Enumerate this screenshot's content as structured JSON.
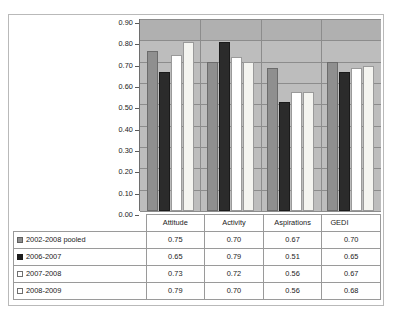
{
  "chart_data": {
    "type": "bar",
    "title": "",
    "xlabel": "",
    "ylabel": "",
    "ylim": [
      0.0,
      0.9
    ],
    "ytick_labels": [
      "0.90",
      "0.80",
      "0.70",
      "0.60",
      "0.50",
      "0.40",
      "0.30",
      "0.20",
      "0.10",
      "0.00"
    ],
    "ytick_values": [
      0.9,
      0.8,
      0.7,
      0.6,
      0.5,
      0.4,
      0.3,
      0.2,
      0.1,
      0.0
    ],
    "grid": true,
    "legend_position": "data-table-first-column",
    "categories": [
      "Attitude",
      "Activity",
      "Aspirations",
      "GEDI"
    ],
    "series": [
      {
        "name": "2002-2008 pooled",
        "swatch": "sw0",
        "bar": "s0",
        "values": [
          0.75,
          0.7,
          0.67,
          0.7
        ]
      },
      {
        "name": "2006-2007",
        "swatch": "sw1",
        "bar": "s1",
        "values": [
          0.65,
          0.79,
          0.51,
          0.65
        ]
      },
      {
        "name": "2007-2008",
        "swatch": "sw2",
        "bar": "s2",
        "values": [
          0.73,
          0.72,
          0.56,
          0.67
        ]
      },
      {
        "name": "2008-2009",
        "swatch": "sw3",
        "bar": "s3",
        "values": [
          0.79,
          0.7,
          0.56,
          0.68
        ]
      }
    ],
    "colors": {
      "series_2002_2008_pooled": "#8f8f8f",
      "series_2006_2007": "#2b2b2b",
      "series_2007_2008": "#ffffff",
      "series_2008_2009": "#f4f4f0",
      "plot_background": "#bdbdbd",
      "gridline": "#8c8c8c",
      "frame_border": "#b9b9b9"
    }
  },
  "table": {
    "corner_label": "",
    "headers": [
      "Attitude",
      "Activity",
      "Aspirations",
      "GEDI"
    ],
    "rows": [
      {
        "label": "2002-2008 pooled",
        "cells": [
          "0.75",
          "0.70",
          "0.67",
          "0.70"
        ]
      },
      {
        "label": "2006-2007",
        "cells": [
          "0.65",
          "0.79",
          "0.51",
          "0.65"
        ]
      },
      {
        "label": "2007-2008",
        "cells": [
          "0.73",
          "0.72",
          "0.56",
          "0.67"
        ]
      },
      {
        "label": "2008-2009",
        "cells": [
          "0.79",
          "0.70",
          "0.56",
          "0.68"
        ]
      }
    ]
  }
}
